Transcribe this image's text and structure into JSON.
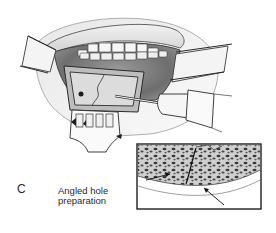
{
  "figure": {
    "panel_letter": "C",
    "caption": {
      "line1": "Angled hole",
      "line2": "preparation"
    },
    "main_illustration": {
      "subject": "open-mouth-surgical-view",
      "elements": [
        "upper-lip",
        "upper-teeth",
        "lower-teeth",
        "cheek-retractor-left",
        "cheek-retractor-right",
        "symphysis-bone-window",
        "drill-handpiece",
        "lower-lip-retractor"
      ]
    },
    "inset": {
      "subject": "bone-cross-section",
      "elements": [
        "cortical-bone",
        "cancellous-bone",
        "osteotomy-line",
        "arrow-left",
        "arrow-right"
      ]
    },
    "colors": {
      "ink": "#1e1e1e",
      "shade_dark": "#6a6a6a",
      "shade_mid": "#a8a8a8",
      "shade_light": "#d8d8d8",
      "paper": "#ffffff"
    }
  }
}
